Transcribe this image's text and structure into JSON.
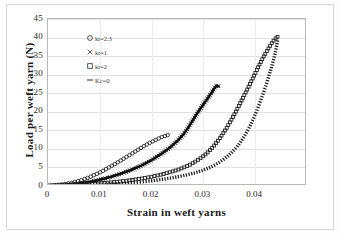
{
  "chart_data": {
    "type": "line",
    "title": "",
    "xlabel": "Strain in weft yarns",
    "ylabel": "Load per weft yarn  (N)",
    "xlim": [
      0,
      0.05
    ],
    "ylim": [
      0,
      45
    ],
    "xticks": [
      "0",
      "0.01",
      "0.02",
      "0.03",
      "0.04"
    ],
    "xtick_values": [
      0,
      0.01,
      0.02,
      0.03,
      0.04
    ],
    "yticks": [
      "0",
      "5",
      "10",
      "15",
      "20",
      "25",
      "30",
      "35",
      "40",
      "45"
    ],
    "ytick_values": [
      0,
      5,
      10,
      15,
      20,
      25,
      30,
      35,
      40,
      45
    ],
    "grid": "horizontal",
    "legend_position": "upper-left-inside",
    "series": [
      {
        "name": "kt=2.3",
        "legend_label": "kt=2.3",
        "marker": "open-circle",
        "color": "#1a1a1a",
        "x": [
          0,
          0.0015,
          0.003,
          0.0045,
          0.006,
          0.0075,
          0.009,
          0.0105,
          0.012,
          0.0135,
          0.015,
          0.0165,
          0.018,
          0.0192,
          0.0202,
          0.0212,
          0.022,
          0.0226,
          0.0231
        ],
        "y": [
          0.1,
          0.25,
          0.5,
          0.85,
          1.4,
          2.1,
          3.0,
          4.0,
          5.2,
          6.4,
          7.7,
          9.0,
          10.3,
          11.3,
          12.0,
          12.7,
          13.2,
          13.5,
          13.7
        ]
      },
      {
        "name": "kt=1",
        "legend_label": "kt=1",
        "marker": "cross",
        "color": "#111111",
        "x": [
          0,
          0.002,
          0.004,
          0.006,
          0.008,
          0.01,
          0.012,
          0.014,
          0.016,
          0.018,
          0.02,
          0.022,
          0.0235,
          0.025,
          0.0262,
          0.0272,
          0.0282,
          0.029,
          0.0298,
          0.0306,
          0.0312,
          0.0317,
          0.0321,
          0.0325,
          0.0329
        ],
        "y": [
          0.1,
          0.2,
          0.4,
          0.7,
          1.1,
          1.7,
          2.4,
          3.3,
          4.3,
          5.5,
          7.0,
          8.8,
          10.3,
          12.2,
          14.0,
          16.0,
          18.3,
          20.0,
          21.6,
          23.2,
          24.4,
          25.4,
          26.3,
          27.0,
          26.9
        ]
      },
      {
        "name": "kt=2",
        "legend_label": "kt=2",
        "marker": "open-square",
        "color": "#1a1a1a",
        "x": [
          0,
          0.003,
          0.006,
          0.009,
          0.012,
          0.015,
          0.018,
          0.021,
          0.0235,
          0.0255,
          0.0272,
          0.0288,
          0.0302,
          0.0315,
          0.0328,
          0.0341,
          0.0353,
          0.0364,
          0.0375,
          0.0386,
          0.0396,
          0.0405,
          0.0413,
          0.0421,
          0.0428,
          0.0434,
          0.0439,
          0.0443
        ],
        "y": [
          0.05,
          0.15,
          0.35,
          0.6,
          0.95,
          1.4,
          2.0,
          2.8,
          3.7,
          4.6,
          5.6,
          6.9,
          8.3,
          10.0,
          12.2,
          14.8,
          17.6,
          20.4,
          23.4,
          26.4,
          29.2,
          31.8,
          34.0,
          36.0,
          37.6,
          38.9,
          39.7,
          40.2
        ]
      },
      {
        "name": "Kc=0",
        "legend_label": "Kc=0",
        "marker": "dash-line",
        "color": "#1c1c1c",
        "x": [
          0,
          0.004,
          0.008,
          0.012,
          0.016,
          0.02,
          0.023,
          0.0258,
          0.0282,
          0.0302,
          0.032,
          0.0336,
          0.0351,
          0.0365,
          0.0378,
          0.039,
          0.0401,
          0.0411,
          0.042,
          0.0428,
          0.0435,
          0.044,
          0.0444
        ],
        "y": [
          0.05,
          0.1,
          0.25,
          0.5,
          0.85,
          1.4,
          2.0,
          2.7,
          3.5,
          4.4,
          5.5,
          6.9,
          8.6,
          10.6,
          13.2,
          16.2,
          19.6,
          23.2,
          26.8,
          30.4,
          33.8,
          36.8,
          39.8
        ]
      }
    ]
  },
  "legend": {
    "items": [
      {
        "marker": "open-circle",
        "label": "kt=2.3"
      },
      {
        "marker": "cross",
        "label": "kt=1"
      },
      {
        "marker": "open-square",
        "label": "kt=2"
      },
      {
        "marker": "dash-line",
        "label": "Kc=0"
      }
    ]
  },
  "colors": {
    "series_ink": "#1a1a1a",
    "gridline": "#e2e2e6",
    "axis": "#b9b9b9",
    "background": "#ffffff"
  }
}
